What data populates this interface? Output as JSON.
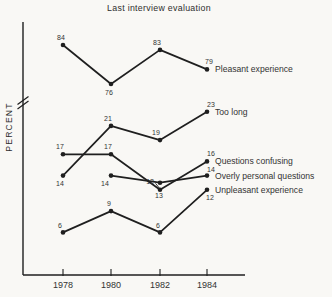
{
  "figure": {
    "title": "Last interview evaluation",
    "y_axis_label": "PERCENT",
    "has_axis_break": true,
    "ink_color": "#1f1f1f",
    "background_color": "#f9f8f5"
  },
  "chart_data": {
    "type": "line",
    "title": "Last interview evaluation",
    "xlabel": "",
    "ylabel": "PERCENT",
    "categories": [
      "1978",
      "1980",
      "1982",
      "1984"
    ],
    "axis_break_between": [
      23,
      76
    ],
    "grid": false,
    "legend_position": "right-of-last-point",
    "series": [
      {
        "name": "Pleasant experience",
        "values": [
          84,
          76,
          83,
          79
        ]
      },
      {
        "name": "Too long",
        "values": [
          14,
          21,
          19,
          23
        ]
      },
      {
        "name": "Questions confusing",
        "values": [
          17,
          17,
          12,
          16
        ]
      },
      {
        "name": "Overly personal questions",
        "values": [
          null,
          14,
          13,
          14
        ]
      },
      {
        "name": "Unpleasant experience",
        "values": [
          6,
          9,
          6,
          12
        ]
      }
    ]
  }
}
